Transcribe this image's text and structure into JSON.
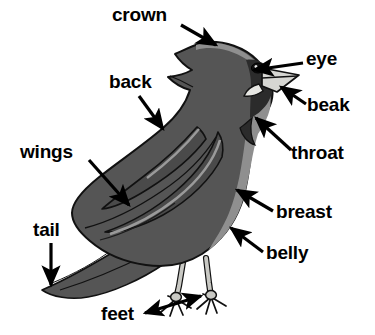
{
  "diagram": {
    "background_color": "#ffffff",
    "colors": {
      "body_fill": "#555555",
      "body_highlight": "#8f8f8f",
      "head_dark": "#2b2b2b",
      "beak_fill": "#d6d6d2",
      "leg_fill": "#c9c9c4",
      "outline": "#111111",
      "label_text": "#000000",
      "arrow": "#000000"
    },
    "labels": [
      {
        "id": "crown",
        "text": "crown",
        "text_x": 112,
        "text_y": 21,
        "anchor": "start",
        "arrow": {
          "x1": 181,
          "y1": 25,
          "x2": 216,
          "y2": 45,
          "double": false
        }
      },
      {
        "id": "back",
        "text": "back",
        "text_x": 109,
        "text_y": 88,
        "anchor": "start",
        "arrow": {
          "x1": 139,
          "y1": 96,
          "x2": 163,
          "y2": 129,
          "double": false
        }
      },
      {
        "id": "eye",
        "text": "eye",
        "text_x": 306,
        "text_y": 65,
        "anchor": "start",
        "arrow": {
          "x1": 303,
          "y1": 63,
          "x2": 254,
          "y2": 70,
          "double": false
        }
      },
      {
        "id": "beak",
        "text": "beak",
        "text_x": 307,
        "text_y": 111,
        "anchor": "start",
        "arrow": {
          "x1": 306,
          "y1": 104,
          "x2": 281,
          "y2": 87,
          "double": false
        }
      },
      {
        "id": "throat",
        "text": "throat",
        "text_x": 291,
        "text_y": 159,
        "anchor": "start",
        "arrow": {
          "x1": 291,
          "y1": 150,
          "x2": 256,
          "y2": 118,
          "double": false
        }
      },
      {
        "id": "wings",
        "text": "wings",
        "text_x": 20,
        "text_y": 158,
        "anchor": "start",
        "arrow": {
          "x1": 89,
          "y1": 160,
          "x2": 129,
          "y2": 205,
          "double": false
        }
      },
      {
        "id": "breast",
        "text": "breast",
        "text_x": 276,
        "text_y": 218,
        "anchor": "start",
        "arrow": {
          "x1": 273,
          "y1": 211,
          "x2": 237,
          "y2": 190,
          "double": false
        }
      },
      {
        "id": "belly",
        "text": "belly",
        "text_x": 266,
        "text_y": 259,
        "anchor": "start",
        "arrow": {
          "x1": 263,
          "y1": 252,
          "x2": 231,
          "y2": 228,
          "double": false
        }
      },
      {
        "id": "tail",
        "text": "tail",
        "text_x": 33,
        "text_y": 236,
        "anchor": "start",
        "arrow": {
          "x1": 51,
          "y1": 243,
          "x2": 51,
          "y2": 285,
          "double": false
        }
      },
      {
        "id": "feet",
        "text": "feet",
        "text_x": 101,
        "text_y": 320,
        "anchor": "start",
        "arrow": {
          "x1": 145,
          "y1": 313,
          "x2": 201,
          "y2": 296,
          "double": true
        }
      }
    ]
  }
}
